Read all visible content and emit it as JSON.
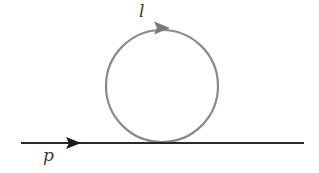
{
  "diagram": {
    "type": "feynman-diagram",
    "labels": {
      "loop_momentum": "l",
      "external_momentum": "p"
    },
    "colors": {
      "background": "#ffffff",
      "external_line": "#2a2a2a",
      "loop_line": "#8a8a8a",
      "external_arrow": "#1a1a1a",
      "loop_arrow": "#7a7a7a",
      "label_text": "#3a3a3a"
    },
    "elements": {
      "external_line": {
        "x1": 21,
        "y1": 143,
        "x2": 304,
        "y2": 143,
        "arrow_tip_x": 80,
        "direction": "right"
      },
      "loop": {
        "cx": 162,
        "cy": 85,
        "r": 56,
        "arrow_at": "top",
        "direction": "clockwise"
      }
    }
  }
}
